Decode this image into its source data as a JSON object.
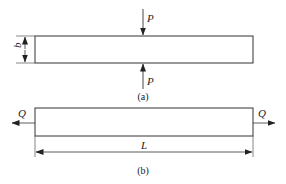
{
  "figure_a": {
    "caption": "(a)",
    "force_top_label": "P",
    "force_bottom_label": "P",
    "dimension_label": "b"
  },
  "figure_b": {
    "caption": "(b)",
    "force_left_label": "Q",
    "force_right_label": "Q",
    "dimension_label": "L"
  },
  "colors": {
    "line": "#333333",
    "background": "#ffffff"
  }
}
